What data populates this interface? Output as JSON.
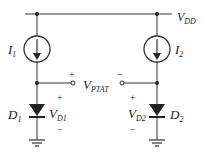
{
  "diagram": {
    "supply": {
      "name": "V",
      "sub": "DD"
    },
    "sources": [
      {
        "name": "I",
        "sub": "1",
        "x": 37
      },
      {
        "name": "I",
        "sub": "2",
        "x": 157
      }
    ],
    "diodes": [
      {
        "name": "D",
        "sub": "1",
        "voltage": {
          "name": "V",
          "sub": "D1"
        },
        "plus": "+",
        "minus": "−"
      },
      {
        "name": "D",
        "sub": "2",
        "voltage": {
          "name": "V",
          "sub": "D2"
        },
        "plus": "+",
        "minus": "−"
      }
    ],
    "output": {
      "name": "V",
      "sub": "PTAT",
      "plus": "+",
      "minus": "−"
    },
    "colors": {
      "wire": "#333333",
      "text": "#222222",
      "background": "#ffffff"
    }
  }
}
